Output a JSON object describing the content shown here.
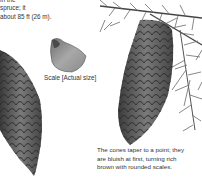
{
  "intro_text": {
    "lines": [
      "in the",
      "spruce; it",
      "about 85 ft (26 m)."
    ]
  },
  "scale_caption": "Scale [Actual size]",
  "cones_caption": {
    "lines": [
      "The cones taper to a point; they",
      "are bluish at first, turning rich",
      "brown with rounded scales."
    ]
  },
  "illustrations": [
    {
      "name": "spruce-branch-with-needles"
    },
    {
      "name": "large-hanging-spruce-cone"
    },
    {
      "name": "left-spruce-cone"
    },
    {
      "name": "single-cone-scale"
    }
  ]
}
